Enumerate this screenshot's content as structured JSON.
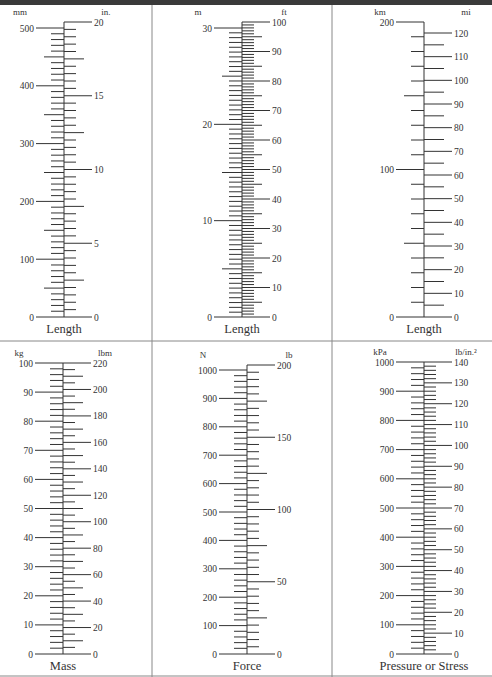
{
  "chart_data": [
    {
      "type": "conversion-scale",
      "title": "Length",
      "left": {
        "unit": "mm",
        "min": 0,
        "max": 500,
        "major": 100,
        "minor": 10,
        "labels": [
          0,
          100,
          200,
          300,
          400,
          500
        ]
      },
      "right": {
        "unit": "in.",
        "min": 0,
        "max": 20,
        "major": 5,
        "minor": 0.5,
        "labels": [
          0,
          5,
          10,
          15,
          20
        ]
      },
      "geom": {
        "x": 64,
        "y0": 317,
        "ytopLeft": 28,
        "ytopRight": 22
      }
    },
    {
      "type": "conversion-scale",
      "title": "Length",
      "left": {
        "unit": "m",
        "min": 0,
        "max": 30,
        "major": 10,
        "minor": 0.5,
        "labels": [
          0,
          10,
          20,
          30
        ]
      },
      "right": {
        "unit": "ft",
        "min": 0,
        "max": 100,
        "major": 10,
        "minor": 1,
        "labels": [
          0,
          10,
          20,
          30,
          40,
          50,
          60,
          70,
          80,
          90,
          100
        ]
      },
      "geom": {
        "x": 242,
        "y0": 317,
        "ytopLeft": 28,
        "ytopRight": 22
      }
    },
    {
      "type": "conversion-scale",
      "title": "Length",
      "left": {
        "unit": "km",
        "min": 0,
        "max": 200,
        "major": 100,
        "minor": 10,
        "labels": [
          0,
          100,
          200
        ]
      },
      "right": {
        "unit": "mi",
        "min": 0,
        "max": 120,
        "major": 10,
        "minor": 5,
        "labels": [
          0,
          10,
          20,
          30,
          40,
          50,
          60,
          70,
          80,
          90,
          100,
          110,
          120
        ]
      },
      "geom": {
        "x": 424,
        "y0": 317,
        "ytopLeft": 22,
        "ytopRight": 33
      }
    },
    {
      "type": "conversion-scale",
      "title": "Mass",
      "left": {
        "unit": "kg",
        "min": 0,
        "max": 100,
        "major": 10,
        "minor": 2,
        "labels": [
          0,
          10,
          20,
          30,
          40,
          50,
          60,
          70,
          80,
          90,
          100
        ]
      },
      "right": {
        "unit": "lbm",
        "min": 0,
        "max": 220,
        "major": 20,
        "minor": 5,
        "labels": [
          0,
          20,
          40,
          60,
          80,
          100,
          120,
          140,
          160,
          180,
          200,
          220
        ]
      },
      "geom": {
        "x": 63,
        "y0": 654,
        "ytopLeft": 363,
        "ytopRight": 363
      }
    },
    {
      "type": "conversion-scale",
      "title": "Force",
      "left": {
        "unit": "N",
        "min": 0,
        "max": 1000,
        "major": 100,
        "minor": 20,
        "labels": [
          0,
          100,
          200,
          300,
          400,
          500,
          600,
          700,
          800,
          900,
          1000
        ]
      },
      "right": {
        "unit": "lb",
        "min": 0,
        "max": 200,
        "major": 50,
        "minor": 5,
        "labels": [
          0,
          50,
          100,
          150,
          200
        ]
      },
      "geom": {
        "x": 247,
        "y0": 654,
        "ytopLeft": 370,
        "ytopRight": 365
      }
    },
    {
      "type": "conversion-scale",
      "title": "Pressure or Stress",
      "left": {
        "unit": "kPa",
        "min": 0,
        "max": 1000,
        "major": 100,
        "minor": 20,
        "labels": [
          0,
          100,
          200,
          300,
          400,
          500,
          600,
          700,
          800,
          900,
          1000
        ]
      },
      "right": {
        "unit": "lb/in.²",
        "min": 0,
        "max": 140,
        "major": 10,
        "minor": 2,
        "labels": [
          0,
          10,
          20,
          30,
          40,
          50,
          60,
          70,
          80,
          90,
          100,
          110,
          120,
          130,
          140
        ]
      },
      "geom": {
        "x": 424,
        "y0": 654,
        "ytopLeft": 362,
        "ytopRight": 362
      }
    }
  ]
}
